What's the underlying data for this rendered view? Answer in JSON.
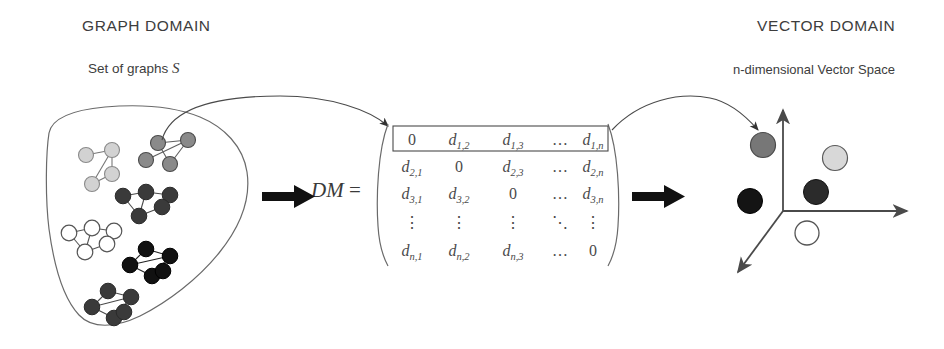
{
  "titles": {
    "graph_domain": "GRAPH DOMAIN",
    "vector_domain": "VECTOR DOMAIN"
  },
  "labels": {
    "set_of_graphs": "Set of graphs",
    "set_of_graphs_symbol": "S",
    "vector_space": "n-dimensional Vector Space",
    "dm": "DM",
    "dm_equals": "="
  },
  "matrix": {
    "highlight_first_row": true,
    "rows": [
      [
        "0",
        "d_{1,2}",
        "d_{1,3}",
        "…",
        "d_{1,n}"
      ],
      [
        "d_{2,1}",
        "0",
        "d_{2,3}",
        "…",
        "d_{2,n}"
      ],
      [
        "d_{3,1}",
        "d_{3,2}",
        "0",
        "…",
        "d_{3,n}"
      ],
      [
        "⋮",
        "⋮",
        "⋮",
        "⋱",
        "⋮"
      ],
      [
        "d_{n,1}",
        "d_{n,2}",
        "d_{n,3}",
        "…",
        "0"
      ]
    ],
    "cells": [
      [
        {
          "base": "0",
          "sub": ""
        },
        {
          "base": "d",
          "sub": "1,2"
        },
        {
          "base": "d",
          "sub": "1,3"
        },
        {
          "base": "…",
          "sub": ""
        },
        {
          "base": "d",
          "sub": "1,n"
        }
      ],
      [
        {
          "base": "d",
          "sub": "2,1"
        },
        {
          "base": "0",
          "sub": ""
        },
        {
          "base": "d",
          "sub": "2,3"
        },
        {
          "base": "…",
          "sub": ""
        },
        {
          "base": "d",
          "sub": "2,n"
        }
      ],
      [
        {
          "base": "d",
          "sub": "3,1"
        },
        {
          "base": "d",
          "sub": "3,2"
        },
        {
          "base": "0",
          "sub": ""
        },
        {
          "base": "…",
          "sub": ""
        },
        {
          "base": "d",
          "sub": "3,n"
        }
      ],
      [
        {
          "base": "⋮",
          "sub": ""
        },
        {
          "base": "⋮",
          "sub": ""
        },
        {
          "base": "⋮",
          "sub": ""
        },
        {
          "base": "⋱",
          "sub": ""
        },
        {
          "base": "⋮",
          "sub": ""
        }
      ],
      [
        {
          "base": "d",
          "sub": "n,1"
        },
        {
          "base": "d",
          "sub": "n,2"
        },
        {
          "base": "d",
          "sub": "n,3"
        },
        {
          "base": "…",
          "sub": ""
        },
        {
          "base": "0",
          "sub": ""
        }
      ]
    ]
  },
  "graph_set": {
    "description": "Set of six small graphs drawn inside a hand-drawn closed curve",
    "graphs": [
      {
        "name": "graph-light-gray-4node",
        "shade": "#d2d2d2",
        "nodes": 4
      },
      {
        "name": "graph-medium-gray-4node",
        "shade": "#8a8a8a",
        "nodes": 4
      },
      {
        "name": "graph-dark-gray-5node",
        "shade": "#3a3a3a",
        "nodes": 5
      },
      {
        "name": "graph-white-5node",
        "shade": "#ffffff",
        "nodes": 5
      },
      {
        "name": "graph-black-5node",
        "shade": "#111111",
        "nodes": 5
      },
      {
        "name": "graph-dark-gray-5node-lower",
        "shade": "#3a3a3a",
        "nodes": 5
      }
    ]
  },
  "vector_space": {
    "axes": 3,
    "points": [
      {
        "name": "point-medium-gray",
        "shade": "#777777"
      },
      {
        "name": "point-light-gray",
        "shade": "#d8d8d8"
      },
      {
        "name": "point-black",
        "shade": "#141414"
      },
      {
        "name": "point-dark-gray",
        "shade": "#2b2b2b"
      },
      {
        "name": "point-white",
        "shade": "#ffffff"
      }
    ]
  },
  "colors": {
    "stroke": "#4a4a4a",
    "arrow_fill": "#111111",
    "text": "#3d3d3d"
  }
}
